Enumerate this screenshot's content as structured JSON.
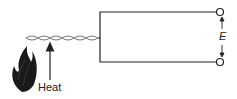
{
  "diagram": {
    "type": "thermocouple",
    "labels": {
      "heat": "Heat",
      "emf": "E"
    },
    "colors": {
      "line": "#222222",
      "flame": "#1a1a1a",
      "background": "#ffffff"
    }
  }
}
